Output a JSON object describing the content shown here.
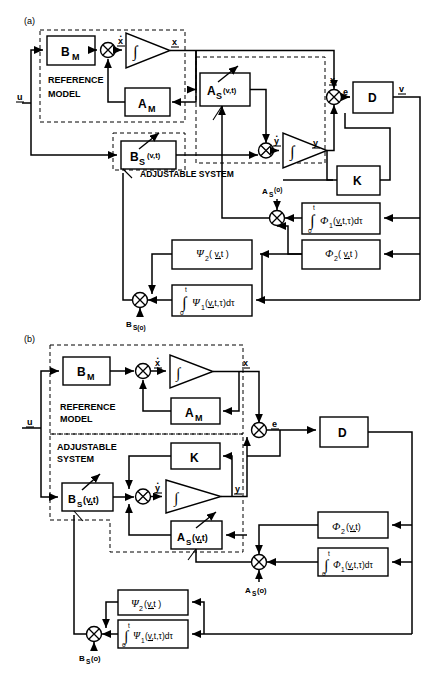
{
  "figure": {
    "panels": [
      {
        "tag": "(a)",
        "group_labels": {
          "reference_model_line1": "REFERENCE",
          "reference_model_line2": "MODEL",
          "adjustable_system": "ADJUSTABLE  SYSTEM"
        },
        "signals": {
          "input": "u",
          "xdot": "x",
          "x": "x",
          "ydot": "y",
          "y": "y",
          "error": "e",
          "v": "v"
        },
        "blocks": [
          {
            "name": "B_M",
            "label": "B",
            "sub": "M"
          },
          {
            "name": "A_M",
            "label": "A",
            "sub": "M"
          },
          {
            "name": "A_S",
            "label": "A",
            "sub": "S",
            "arg": "(v,t)"
          },
          {
            "name": "B_S",
            "label": "B",
            "sub": "S",
            "arg": "(v,t)"
          },
          {
            "name": "D",
            "label": "D"
          },
          {
            "name": "K",
            "label": "K"
          },
          {
            "name": "phi1",
            "label": "∫ Φ₁(v,t,τ)dτ",
            "upper": "t",
            "lower": "o"
          },
          {
            "name": "phi2",
            "label": "Φ₂( v,t )"
          },
          {
            "name": "psi2",
            "label": "Ψ₂( v,t )"
          },
          {
            "name": "psi1",
            "label": "∫ Ψ₁(v,t,τ)dτ",
            "upper": "t",
            "lower": "o"
          }
        ],
        "junction_labels": [
          {
            "name": "as_o",
            "text": "A",
            "sub": "S",
            "arg": "(o)"
          },
          {
            "name": "bs_o",
            "text": "B",
            "sub": "S(o)"
          }
        ],
        "integrator_symbol": "∫"
      },
      {
        "tag": "(b)",
        "group_labels": {
          "reference_model_line1": "REFERENCE",
          "reference_model_line2": "MODEL",
          "adjustable_line1": "ADJUSTABLE",
          "adjustable_line2": "SYSTEM"
        },
        "signals": {
          "input": "u",
          "xdot": "x",
          "x": "x",
          "ydot": "y",
          "y": "y",
          "error": "e"
        },
        "blocks": [
          {
            "name": "B_M",
            "label": "B",
            "sub": "M"
          },
          {
            "name": "A_M",
            "label": "A",
            "sub": "M"
          },
          {
            "name": "K",
            "label": "K"
          },
          {
            "name": "B_S",
            "label": "B",
            "sub": "S",
            "arg": "(v,t)"
          },
          {
            "name": "A_S",
            "label": "A",
            "sub": "S",
            "arg": "(v,t)"
          },
          {
            "name": "D",
            "label": "D"
          },
          {
            "name": "phi2",
            "label": "Φ₂ (v,t)"
          },
          {
            "name": "phi1",
            "label": "∫ Φ₁(v,t,τ)dτ",
            "upper": "t",
            "lower": "o"
          },
          {
            "name": "psi2",
            "label": "Ψ₂ (v,t )"
          },
          {
            "name": "psi1",
            "label": "∫ Ψ₁(v,t,τ)dτ",
            "upper": "t",
            "lower": "o"
          }
        ],
        "junction_labels": [
          {
            "name": "as_o",
            "text": "A",
            "sub": "S",
            "arg": "(o)"
          },
          {
            "name": "bs_o",
            "text": "B",
            "sub": "S",
            "arg": "(o)"
          }
        ],
        "integrator_symbol": "∫"
      }
    ]
  }
}
